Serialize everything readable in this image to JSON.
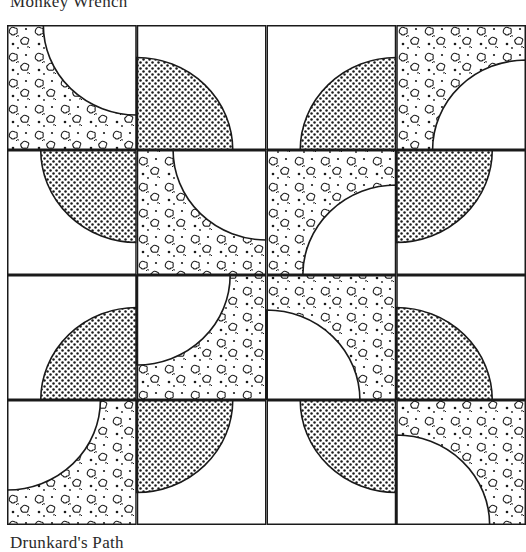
{
  "captions": {
    "top": "Monkey Wrench",
    "bottom": "Drunkard's Path"
  },
  "quilt": {
    "rows": 4,
    "cols": 4,
    "line_color": "#1a1a1a",
    "background": "#ffffff",
    "fills": [
      "dotted",
      "leopard"
    ],
    "tiles": [
      [
        {
          "fill": "leopard",
          "corner": "tr"
        },
        {
          "fill": "dotted",
          "corner": "bl"
        },
        {
          "fill": "dotted",
          "corner": "br"
        },
        {
          "fill": "leopard",
          "corner": "br"
        }
      ],
      [
        {
          "fill": "dotted",
          "corner": "tr"
        },
        {
          "fill": "leopard",
          "corner": "tr"
        },
        {
          "fill": "leopard",
          "corner": "br"
        },
        {
          "fill": "dotted",
          "corner": "tl"
        }
      ],
      [
        {
          "fill": "dotted",
          "corner": "br"
        },
        {
          "fill": "leopard",
          "corner": "tl"
        },
        {
          "fill": "leopard",
          "corner": "bl"
        },
        {
          "fill": "dotted",
          "corner": "bl"
        }
      ],
      [
        {
          "fill": "leopard",
          "corner": "tl"
        },
        {
          "fill": "dotted",
          "corner": "tl"
        },
        {
          "fill": "dotted",
          "corner": "tr"
        },
        {
          "fill": "leopard",
          "corner": "bl"
        }
      ]
    ]
  }
}
